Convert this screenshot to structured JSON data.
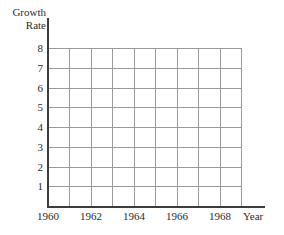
{
  "chart_data": {
    "type": "line",
    "title": "",
    "subtitle": "",
    "xlabel": "Year",
    "ylabel": "Growth Rate",
    "ylabel_lines": [
      "Growth",
      "Rate"
    ],
    "grid": true,
    "legend": "none",
    "series": [],
    "x": [
      1960,
      1961,
      1962,
      1963,
      1964,
      1965,
      1966,
      1967,
      1968,
      1969
    ],
    "xlim": [
      1960,
      1969
    ],
    "ylim": [
      0,
      8
    ],
    "x_tick_values": [
      1960,
      1962,
      1964,
      1966,
      1968
    ],
    "x_tick_labels": [
      "1960",
      "1962",
      "1964",
      "1966",
      "1968"
    ],
    "y_tick_values": [
      1,
      2,
      3,
      4,
      5,
      6,
      7,
      8
    ],
    "y_tick_labels": [
      "1",
      "2",
      "3",
      "4",
      "5",
      "6",
      "7",
      "8"
    ],
    "x_gridline_count": 10,
    "y_gridline_count": 8,
    "annotations": [],
    "note": "Empty plotting grid with no data series drawn"
  },
  "colors": {
    "background": "#ffffff",
    "axis": "#3d3d3d",
    "gridline": "#9a9a9a",
    "text": "#2b2b2b"
  }
}
